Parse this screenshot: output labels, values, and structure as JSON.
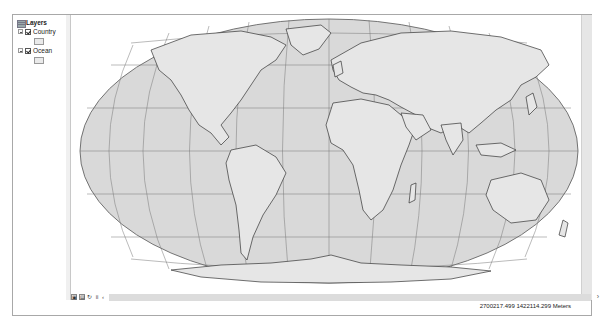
{
  "toc": {
    "title": "Layers",
    "layers": [
      {
        "name": "Country",
        "checked": true
      },
      {
        "name": "Ocean",
        "checked": true
      }
    ]
  },
  "map": {
    "projection_shape": "pseudo-elliptical world map",
    "colors": {
      "land": "#e4e4e4",
      "ocean": "#d8d8d8",
      "border": "#333333",
      "graticule": "#777777"
    }
  },
  "bottom_toolbar": {
    "buttons": [
      "layout-view",
      "data-view",
      "refresh",
      "pause"
    ],
    "scroll_left": "‹",
    "scroll_right": "›"
  },
  "status_bar": {
    "coordinates": "2700217.499  1422114.299 Meters"
  }
}
